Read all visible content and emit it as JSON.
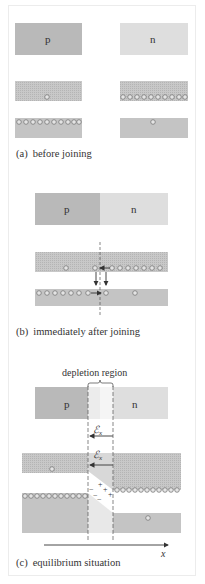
{
  "figure": {
    "panels": [
      {
        "id": "a",
        "caption_tag": "(a)",
        "caption_text": "before joining",
        "p_label": "p",
        "n_label": "n",
        "p_side_upper_band_carriers": 1,
        "n_side_upper_band_carriers": 10,
        "p_side_lower_band_carriers": 10,
        "n_side_lower_band_carriers": 1
      },
      {
        "id": "b",
        "caption_tag": "(b)",
        "caption_text": "immediately after joining",
        "p_label": "p",
        "n_label": "n"
      },
      {
        "id": "c",
        "caption_tag": "(c)",
        "caption_text": "equilibrium situation",
        "p_label": "p",
        "n_label": "n",
        "region_label": "depletion region",
        "field_label": "ℰ",
        "field_subscript": "x",
        "axis_label": "x",
        "neg_charges": "− − −",
        "pos_charges": "+ + +"
      }
    ],
    "colors": {
      "p_block": "#b9b9b9",
      "n_block": "#dedede",
      "band": "#c4c4c4",
      "depletion": "#ececec",
      "carrier_fill": "#e4e4e4",
      "carrier_stroke": "#7a7a7a",
      "text": "#333333"
    }
  }
}
